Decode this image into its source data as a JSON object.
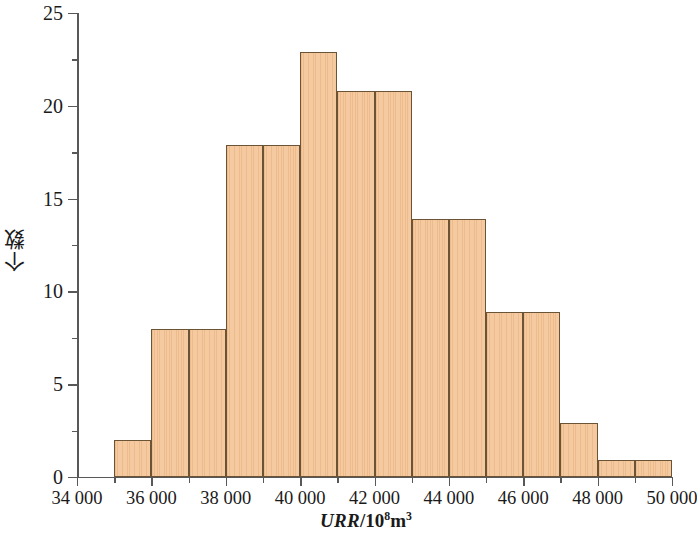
{
  "chart_data": {
    "type": "bar",
    "title": "",
    "subtitle": "",
    "xlabel_parts": {
      "variable": "URR",
      "separator": "/10",
      "exponent": "8",
      "unit": "m",
      "unit_exponent": "3"
    },
    "xlabel": "URR/10^8 m^3",
    "ylabel": "个数",
    "xlim": [
      34000,
      50000
    ],
    "ylim": [
      0,
      25
    ],
    "x_major_ticks": [
      34000,
      36000,
      38000,
      40000,
      42000,
      44000,
      46000,
      48000,
      50000
    ],
    "x_minor_ticks": [
      35000,
      37000,
      39000,
      41000,
      43000,
      45000,
      47000,
      49000
    ],
    "x_tick_labels": [
      "34 000",
      "36 000",
      "38 000",
      "40 000",
      "42 000",
      "44 000",
      "46 000",
      "48 000",
      "50 000"
    ],
    "y_major_ticks": [
      0,
      5,
      10,
      15,
      20,
      25
    ],
    "y_minor_ticks": [
      2.5,
      7.5,
      12.5,
      17.5,
      22.5
    ],
    "y_tick_labels": [
      "0",
      "5",
      "10",
      "15",
      "20",
      "25"
    ],
    "grid": false,
    "legend": null,
    "bin_width": 1000,
    "bins": [
      {
        "start": 35000,
        "end": 36000,
        "value": 2
      },
      {
        "start": 36000,
        "end": 37000,
        "value": 8
      },
      {
        "start": 37000,
        "end": 38000,
        "value": 8
      },
      {
        "start": 38000,
        "end": 39000,
        "value": 17.9
      },
      {
        "start": 39000,
        "end": 40000,
        "value": 17.9
      },
      {
        "start": 40000,
        "end": 41000,
        "value": 22.9
      },
      {
        "start": 41000,
        "end": 42000,
        "value": 20.8
      },
      {
        "start": 42000,
        "end": 43000,
        "value": 20.8
      },
      {
        "start": 43000,
        "end": 44000,
        "value": 13.9
      },
      {
        "start": 44000,
        "end": 45000,
        "value": 13.9
      },
      {
        "start": 45000,
        "end": 46000,
        "value": 8.9
      },
      {
        "start": 46000,
        "end": 47000,
        "value": 8.9
      },
      {
        "start": 47000,
        "end": 48000,
        "value": 2.9
      },
      {
        "start": 48000,
        "end": 49000,
        "value": 0.9
      },
      {
        "start": 49000,
        "end": 50000,
        "value": 0.9
      }
    ],
    "categories": [
      "35000",
      "36000",
      "37000",
      "38000",
      "39000",
      "40000",
      "41000",
      "42000",
      "43000",
      "44000",
      "45000",
      "46000",
      "47000",
      "48000",
      "49000"
    ],
    "values": [
      2,
      8,
      8,
      17.9,
      17.9,
      22.9,
      20.8,
      20.8,
      13.9,
      13.9,
      8.9,
      8.9,
      2.9,
      0.9,
      0.9
    ],
    "colors": {
      "bar_fill": "#f6caa0",
      "bar_border": "#6b5436",
      "axis": "#585858",
      "text": "#1a1a1a",
      "background": "#ffffff"
    }
  }
}
